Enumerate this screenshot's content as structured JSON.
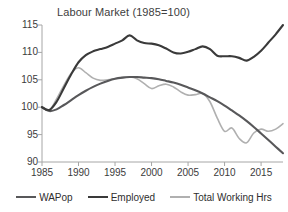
{
  "chart_data": {
    "type": "line",
    "title": "Labour Market (1985=100)",
    "xlabel": "",
    "ylabel": "",
    "xlim": [
      1985,
      2018
    ],
    "ylim": [
      90,
      115
    ],
    "grid": false,
    "legend_position": "bottom",
    "yticks": [
      115,
      110,
      105,
      100,
      95,
      90
    ],
    "xticks": [
      1985,
      1990,
      1995,
      2000,
      2005,
      2010,
      2015
    ],
    "x": [
      1985,
      1986,
      1987,
      1988,
      1989,
      1990,
      1991,
      1992,
      1993,
      1994,
      1995,
      1996,
      1997,
      1998,
      1999,
      2000,
      2001,
      2002,
      2003,
      2004,
      2005,
      2006,
      2007,
      2008,
      2009,
      2010,
      2011,
      2012,
      2013,
      2014,
      2015,
      2016,
      2017,
      2018
    ],
    "series": [
      {
        "name": "WAPop",
        "color": "#58585a",
        "values": [
          100.0,
          99.3,
          99.6,
          100.4,
          101.3,
          102.2,
          103.0,
          103.7,
          104.3,
          104.8,
          105.2,
          105.4,
          105.5,
          105.5,
          105.4,
          105.3,
          105.1,
          104.8,
          104.5,
          104.1,
          103.6,
          103.1,
          102.5,
          101.8,
          101.1,
          100.3,
          99.4,
          98.5,
          97.5,
          96.4,
          95.2,
          94.0,
          92.8,
          91.6
        ]
      },
      {
        "name": "Employed",
        "color": "#3a3a3a",
        "values": [
          100.0,
          99.5,
          101.0,
          103.5,
          106.0,
          108.2,
          109.5,
          110.2,
          110.6,
          111.0,
          111.6,
          112.2,
          113.1,
          112.2,
          111.7,
          111.6,
          111.3,
          110.7,
          110.0,
          109.8,
          110.1,
          110.6,
          111.1,
          110.6,
          109.4,
          109.3,
          109.3,
          109.0,
          108.5,
          109.2,
          110.3,
          111.8,
          113.3,
          115.0
        ]
      },
      {
        "name": "Total Working Hrs",
        "color": "#b0b0b0",
        "values": [
          100.0,
          99.4,
          101.5,
          104.0,
          106.2,
          107.2,
          106.3,
          105.3,
          104.9,
          105.0,
          105.2,
          105.4,
          105.5,
          105.2,
          104.3,
          103.4,
          103.9,
          104.2,
          103.7,
          102.8,
          102.2,
          102.3,
          102.5,
          101.0,
          98.0,
          95.6,
          96.2,
          94.3,
          93.5,
          95.3,
          96.0,
          95.6,
          96.0,
          97.0
        ]
      }
    ]
  },
  "legend": {
    "items": [
      {
        "label": "WAPop",
        "color": "#58585a"
      },
      {
        "label": "Employed",
        "color": "#3a3a3a"
      },
      {
        "label": "Total Working Hrs",
        "color": "#b0b0b0"
      }
    ]
  },
  "axis_colors": {
    "axis_line": "#a6a6a6",
    "tick_text": "#3b3b3b",
    "title_text": "#404040"
  }
}
